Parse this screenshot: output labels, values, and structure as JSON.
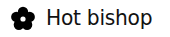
{
  "item": {
    "icon": "flower-icon",
    "label": "Hot bishop"
  },
  "colors": {
    "icon": "#000000",
    "text": "#111111",
    "background": "#ffffff"
  }
}
